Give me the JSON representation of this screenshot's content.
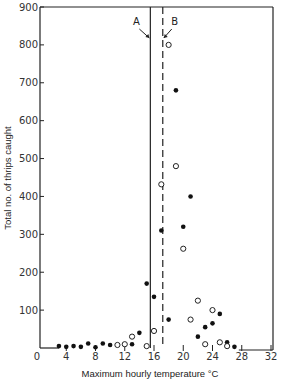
{
  "chart_data": {
    "type": "scatter",
    "title": "",
    "xlabel": "Maximum hourly temperature °C",
    "ylabel": "Total no. of thrips caught",
    "xlim": [
      0,
      32
    ],
    "ylim": [
      0,
      900
    ],
    "x_ticks": [
      0,
      4,
      8,
      12,
      16,
      20,
      24,
      28,
      32
    ],
    "y_ticks": [
      100,
      200,
      300,
      400,
      500,
      600,
      700,
      800,
      900
    ],
    "grid": false,
    "legend": null,
    "series": [
      {
        "name": "filled",
        "marker": "filled-circle",
        "points": [
          [
            3,
            5
          ],
          [
            4,
            3
          ],
          [
            5,
            5
          ],
          [
            6,
            3
          ],
          [
            7,
            12
          ],
          [
            8,
            2
          ],
          [
            9,
            12
          ],
          [
            10,
            8
          ],
          [
            13,
            10
          ],
          [
            14,
            40
          ],
          [
            15,
            170
          ],
          [
            16,
            135
          ],
          [
            17,
            310
          ],
          [
            18,
            75
          ],
          [
            19,
            680
          ],
          [
            20,
            320
          ],
          [
            21,
            400
          ],
          [
            22,
            30
          ],
          [
            23,
            55
          ],
          [
            24,
            65
          ],
          [
            25,
            90
          ],
          [
            26,
            15
          ],
          [
            27,
            3
          ]
        ]
      },
      {
        "name": "open",
        "marker": "open-circle",
        "points": [
          [
            11,
            8
          ],
          [
            12,
            10
          ],
          [
            13,
            30
          ],
          [
            15,
            5
          ],
          [
            16,
            45
          ],
          [
            17,
            432
          ],
          [
            18,
            800
          ],
          [
            19,
            480
          ],
          [
            20,
            262
          ],
          [
            21,
            75
          ],
          [
            22,
            125
          ],
          [
            23,
            10
          ],
          [
            24,
            100
          ],
          [
            25,
            15
          ],
          [
            26,
            5
          ]
        ]
      }
    ],
    "annotations": [
      {
        "label": "A",
        "x": 15.5,
        "style": "solid-vertical-line"
      },
      {
        "label": "B",
        "x": 17.2,
        "style": "dashed-vertical-line"
      }
    ]
  }
}
